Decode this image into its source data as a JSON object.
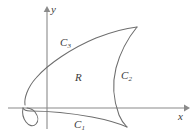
{
  "figure": {
    "type": "math-region-diagram",
    "background_color": "#ffffff",
    "curve_color": "#6d6d6d",
    "axis_color": "#8a8a8a",
    "label_color": "#3b3b3b"
  },
  "axes": {
    "x_axis": {
      "label": "x",
      "label_name": "x-axis-label",
      "arrow": "right",
      "y_pixel": 108,
      "x_start": 8,
      "x_end": 188
    },
    "y_axis": {
      "label": "y",
      "label_name": "y-axis-label",
      "arrow": "up",
      "x_pixel": 47,
      "y_start": 8,
      "y_end": 129
    }
  },
  "region": {
    "label": "R",
    "name": "region-label-r"
  },
  "curves": [
    {
      "id": "c1",
      "label": "C",
      "subscript": "1",
      "description": "lower boundary curve, dips slightly below the x-axis from the left cusp to the lower-right cusp"
    },
    {
      "id": "c2",
      "label": "C",
      "subscript": "2",
      "description": "right boundary curve, concave left, joining the upper-right tip to the lower-right cusp"
    },
    {
      "id": "c3",
      "label": "C",
      "subscript": "3",
      "description": "upper boundary curve, rising from the lower-left toward the upper-right tip"
    }
  ]
}
